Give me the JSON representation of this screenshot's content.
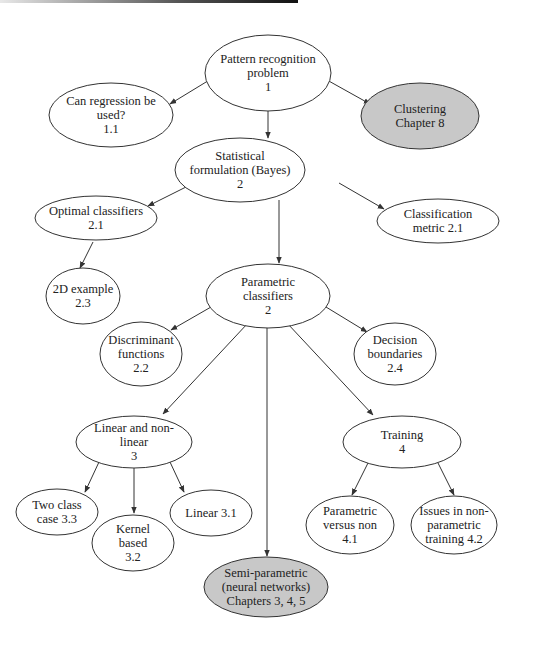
{
  "diagram": {
    "type": "tree",
    "colors": {
      "default_fill": "#ffffff",
      "highlight_fill": "#c8c8c8",
      "stroke": "#333333"
    },
    "nodes": [
      {
        "id": "n1",
        "lines": [
          "Pattern recognition",
          "problem",
          "1"
        ],
        "cx": 268,
        "cy": 73,
        "rx": 63,
        "ry": 38,
        "highlight": false
      },
      {
        "id": "n11",
        "lines": [
          "Can regression be",
          "used?",
          "1.1"
        ],
        "cx": 111,
        "cy": 115,
        "rx": 62,
        "ry": 32,
        "highlight": false
      },
      {
        "id": "n8",
        "lines": [
          "Clustering",
          "Chapter 8"
        ],
        "cx": 420,
        "cy": 116,
        "rx": 59,
        "ry": 33,
        "highlight": true
      },
      {
        "id": "n2",
        "lines": [
          "Statistical",
          "formulation (Bayes)",
          "2"
        ],
        "cx": 240,
        "cy": 170,
        "rx": 65,
        "ry": 32,
        "highlight": false
      },
      {
        "id": "n21",
        "lines": [
          "Optimal classifiers",
          "2.1"
        ],
        "cx": 96,
        "cy": 218,
        "rx": 61,
        "ry": 22,
        "highlight": false
      },
      {
        "id": "n21m",
        "lines": [
          "Classification",
          "metric 2.1"
        ],
        "cx": 438,
        "cy": 221,
        "rx": 61,
        "ry": 22,
        "highlight": false
      },
      {
        "id": "n23",
        "lines": [
          "2D example",
          "2.3"
        ],
        "cx": 83,
        "cy": 296,
        "rx": 37,
        "ry": 28,
        "highlight": false
      },
      {
        "id": "n2p",
        "lines": [
          "Parametric",
          "classifiers",
          "2"
        ],
        "cx": 268,
        "cy": 296,
        "rx": 62,
        "ry": 32,
        "highlight": false
      },
      {
        "id": "n22",
        "lines": [
          "Discriminant",
          "functions",
          "2.2"
        ],
        "cx": 141,
        "cy": 354,
        "rx": 41,
        "ry": 32,
        "highlight": false
      },
      {
        "id": "n24",
        "lines": [
          "Decision",
          "boundaries",
          "2.4"
        ],
        "cx": 395,
        "cy": 354,
        "rx": 41,
        "ry": 31,
        "highlight": false
      },
      {
        "id": "n3",
        "lines": [
          "Linear and non-",
          "linear",
          "3"
        ],
        "cx": 134,
        "cy": 442,
        "rx": 58,
        "ry": 26,
        "highlight": false
      },
      {
        "id": "n4",
        "lines": [
          "Training",
          "4"
        ],
        "cx": 402,
        "cy": 442,
        "rx": 59,
        "ry": 26,
        "highlight": false
      },
      {
        "id": "n33",
        "lines": [
          "Two class",
          "case 3.3"
        ],
        "cx": 57,
        "cy": 512,
        "rx": 41,
        "ry": 23,
        "highlight": false
      },
      {
        "id": "n32",
        "lines": [
          "Kernel",
          "based",
          "3.2"
        ],
        "cx": 133,
        "cy": 543,
        "rx": 41,
        "ry": 28,
        "highlight": false
      },
      {
        "id": "n31",
        "lines": [
          "Linear 3.1"
        ],
        "cx": 211,
        "cy": 513,
        "rx": 41,
        "ry": 23,
        "highlight": false
      },
      {
        "id": "n41",
        "lines": [
          "Parametric",
          "versus non",
          "4.1"
        ],
        "cx": 350,
        "cy": 525,
        "rx": 44,
        "ry": 29,
        "highlight": false
      },
      {
        "id": "n42",
        "lines": [
          "Issues in non-",
          "parametric",
          "training 4.2"
        ],
        "cx": 454,
        "cy": 525,
        "rx": 43,
        "ry": 29,
        "highlight": false
      },
      {
        "id": "n345",
        "lines": [
          "Semi-parametric",
          "(neural networks)",
          "Chapters 3, 4, 5"
        ],
        "cx": 266,
        "cy": 587,
        "rx": 62,
        "ry": 30,
        "highlight": true
      }
    ],
    "edges": [
      {
        "from": "n1",
        "to": "n11",
        "x1": 211,
        "y1": 79,
        "x2": 170,
        "y2": 104
      },
      {
        "from": "n1",
        "to": "n2",
        "x1": 268,
        "y1": 95,
        "x2": 268,
        "y2": 138
      },
      {
        "from": "n1",
        "to": "n8",
        "x1": 327,
        "y1": 80,
        "x2": 370,
        "y2": 104
      },
      {
        "from": "n2",
        "to": "n21",
        "x1": 194,
        "y1": 183,
        "x2": 148,
        "y2": 206
      },
      {
        "from": "n2",
        "to": "n21m",
        "x1": 339,
        "y1": 183,
        "x2": 384,
        "y2": 209
      },
      {
        "from": "n2",
        "to": "n2p",
        "x1": 279,
        "y1": 200,
        "x2": 279,
        "y2": 263
      },
      {
        "from": "n21",
        "to": "n23",
        "x1": 93,
        "y1": 242,
        "x2": 80,
        "y2": 268
      },
      {
        "from": "n2p",
        "to": "n22",
        "x1": 211,
        "y1": 307,
        "x2": 171,
        "y2": 330
      },
      {
        "from": "n2p",
        "to": "n24",
        "x1": 326,
        "y1": 307,
        "x2": 367,
        "y2": 332
      },
      {
        "from": "n2p",
        "to": "n3",
        "x1": 248,
        "y1": 323,
        "x2": 163,
        "y2": 414
      },
      {
        "from": "n2p",
        "to": "n345",
        "x1": 267,
        "y1": 325,
        "x2": 267,
        "y2": 556
      },
      {
        "from": "n2p",
        "to": "n4",
        "x1": 287,
        "y1": 323,
        "x2": 373,
        "y2": 415
      },
      {
        "from": "n3",
        "to": "n33",
        "x1": 99,
        "y1": 462,
        "x2": 85,
        "y2": 492
      },
      {
        "from": "n3",
        "to": "n32",
        "x1": 134,
        "y1": 468,
        "x2": 134,
        "y2": 513
      },
      {
        "from": "n3",
        "to": "n31",
        "x1": 170,
        "y1": 462,
        "x2": 184,
        "y2": 492
      },
      {
        "from": "n4",
        "to": "n41",
        "x1": 368,
        "y1": 463,
        "x2": 352,
        "y2": 495
      },
      {
        "from": "n4",
        "to": "n42",
        "x1": 438,
        "y1": 463,
        "x2": 454,
        "y2": 495
      }
    ]
  }
}
